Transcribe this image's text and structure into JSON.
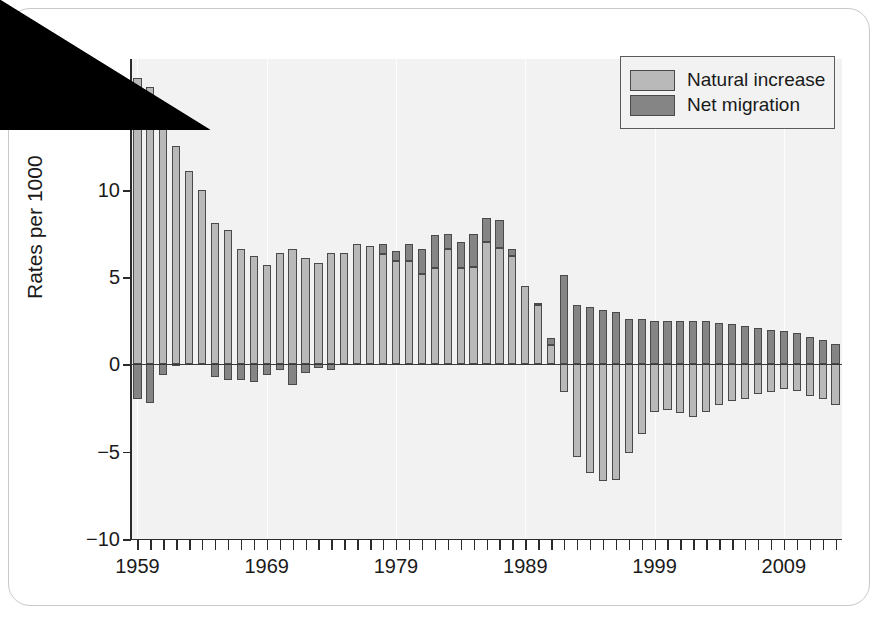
{
  "figure": {
    "background_color": "#ffffff",
    "plot_background_color": "#f2f2f2",
    "frame_color": "#c9c9cd"
  },
  "y_axis_title": "Rates per 1000",
  "legend": {
    "items": [
      {
        "label": "Natural increase",
        "color": "#b9b9b9",
        "key": "natural"
      },
      {
        "label": "Net migration",
        "color": "#858585",
        "key": "migration"
      }
    ]
  },
  "chart_data": {
    "type": "bar",
    "subtype": "stacked-diverging",
    "title": "",
    "xlabel": "",
    "ylabel": "Rates per 1000",
    "ylim": [
      -10,
      17.5
    ],
    "yticks": [
      15,
      10,
      5,
      0,
      -5,
      -10
    ],
    "ytick_labels": [
      "15",
      "10",
      "5",
      "0",
      "−5",
      "−10"
    ],
    "xlim": [
      1958.5,
      2013.5
    ],
    "xticks_all_years": true,
    "xtick_labels": [
      "1959",
      "1969",
      "1979",
      "1989",
      "1999",
      "2009"
    ],
    "xtick_label_years": [
      1959,
      1969,
      1979,
      1989,
      1999,
      2009
    ],
    "grid": false,
    "vertical_gridlines_at": [
      1959,
      1969,
      1979,
      1989,
      1999,
      2009
    ],
    "legend_position": "top-right",
    "bar_border_color": "#4a4a4a",
    "categories": [
      1959,
      1960,
      1961,
      1962,
      1963,
      1964,
      1965,
      1966,
      1967,
      1968,
      1969,
      1970,
      1971,
      1972,
      1973,
      1974,
      1975,
      1976,
      1977,
      1978,
      1979,
      1980,
      1981,
      1982,
      1983,
      1984,
      1985,
      1986,
      1987,
      1988,
      1989,
      1990,
      1991,
      1992,
      1993,
      1994,
      1995,
      1996,
      1997,
      1998,
      1999,
      2000,
      2001,
      2002,
      2003,
      2004,
      2005,
      2006,
      2007,
      2008,
      2009,
      2010,
      2011,
      2012,
      2013
    ],
    "series": [
      {
        "name": "Natural increase",
        "color": "#b9b9b9",
        "values": [
          16.4,
          15.9,
          14.6,
          12.5,
          11.1,
          10.0,
          8.1,
          7.7,
          6.6,
          6.2,
          5.7,
          6.4,
          6.6,
          6.1,
          5.8,
          6.4,
          6.4,
          6.9,
          6.8,
          6.3,
          5.9,
          5.9,
          5.2,
          5.5,
          6.6,
          5.5,
          5.6,
          7.0,
          6.7,
          6.2,
          4.5,
          3.4,
          1.1,
          -1.6,
          -5.3,
          -6.2,
          -6.7,
          -6.6,
          -5.1,
          -4.0,
          -2.7,
          -2.6,
          -2.8,
          -3.0,
          -2.7,
          -2.3,
          -2.1,
          -2.0,
          -1.7,
          -1.6,
          -1.4,
          -1.5,
          -1.8,
          -2.0,
          -2.3
        ]
      },
      {
        "name": "Net migration",
        "color": "#858585",
        "values": [
          -2.0,
          -2.2,
          -0.6,
          -0.1,
          0.0,
          0.0,
          -0.7,
          -0.9,
          -0.9,
          -1.0,
          -0.6,
          -0.3,
          -1.2,
          -0.5,
          -0.2,
          -0.3,
          0.0,
          0.0,
          0.0,
          0.6,
          0.6,
          1.0,
          1.4,
          1.9,
          0.9,
          1.5,
          1.9,
          1.4,
          1.6,
          0.4,
          0.0,
          0.1,
          0.4,
          5.1,
          3.4,
          3.3,
          3.1,
          3.0,
          2.6,
          2.6,
          2.5,
          2.5,
          2.5,
          2.5,
          2.5,
          2.4,
          2.3,
          2.2,
          2.1,
          2.0,
          1.9,
          1.8,
          1.6,
          1.4,
          1.2
        ]
      }
    ]
  }
}
